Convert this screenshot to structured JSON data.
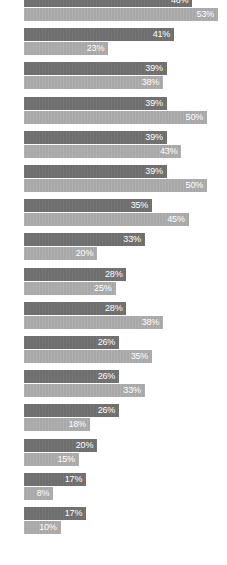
{
  "chart_data": {
    "type": "bar",
    "orientation": "horizontal",
    "title": "",
    "subtitle": "",
    "xlabel": "",
    "ylabel": "",
    "xlim": [
      0,
      53
    ],
    "grid": false,
    "legend": null,
    "categories": [
      "",
      "",
      "",
      "",
      "",
      "",
      "",
      "",
      "",
      "",
      "",
      "",
      "",
      "",
      "",
      ""
    ],
    "colors": {
      "series_1": "#6e6e6e",
      "series_2": "#a8a8a8",
      "label_text": "#ffffff",
      "background": "#ffffff"
    },
    "series": [
      {
        "name": "series_1",
        "color": "#6e6e6e",
        "values": [
          46,
          41,
          39,
          39,
          39,
          39,
          35,
          33,
          28,
          28,
          26,
          26,
          26,
          20,
          17,
          17
        ],
        "labels": [
          "46%",
          "41%",
          "39%",
          "39%",
          "39%",
          "39%",
          "35%",
          "33%",
          "28%",
          "28%",
          "26%",
          "26%",
          "26%",
          "20%",
          "17%",
          "17%"
        ]
      },
      {
        "name": "series_2",
        "color": "#a8a8a8",
        "values": [
          53,
          23,
          38,
          50,
          43,
          50,
          45,
          20,
          25,
          38,
          35,
          33,
          18,
          15,
          8,
          10
        ],
        "labels": [
          "53%",
          "23%",
          "38%",
          "50%",
          "43%",
          "50%",
          "45%",
          "20%",
          "25%",
          "38%",
          "35%",
          "33%",
          "18%",
          "15%",
          "8%",
          "10%"
        ]
      }
    ]
  }
}
